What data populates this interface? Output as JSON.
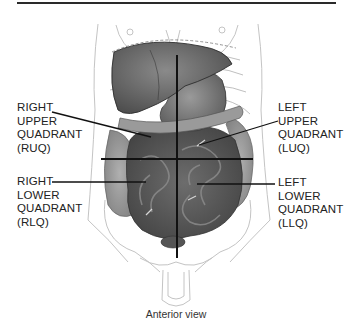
{
  "figure": {
    "caption": "Anterior view",
    "colors": {
      "line": "#111111",
      "organ_dark": "#4a4a4a",
      "organ_mid": "#777777",
      "outline": "#bdbdbd"
    }
  },
  "labels": {
    "ruq": {
      "lines": [
        "RIGHT",
        "UPPER",
        "QUADRANT",
        "(RUQ)"
      ]
    },
    "luq": {
      "lines": [
        "LEFT",
        "UPPER",
        "QUADRANT",
        "(LUQ)"
      ]
    },
    "rlq": {
      "lines": [
        "RIGHT",
        "LOWER",
        "QUADRANT",
        "(RLQ)"
      ]
    },
    "llq": {
      "lines": [
        "LEFT",
        "LOWER",
        "QUADRANT",
        "(LLQ)"
      ]
    }
  }
}
